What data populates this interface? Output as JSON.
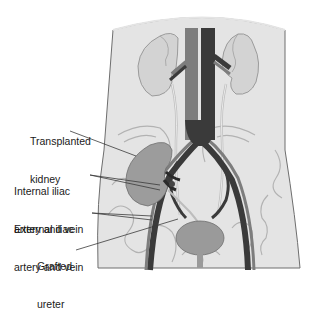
{
  "diagram": {
    "labels": [
      {
        "id": "transplanted-kidney",
        "lines": [
          "Transplanted",
          "kidney"
        ]
      },
      {
        "id": "internal-iliac",
        "lines": [
          "Internal iliac",
          "artery and vein"
        ]
      },
      {
        "id": "external-iliac",
        "lines": [
          "External iliac",
          "artery and vein"
        ]
      },
      {
        "id": "grafted-ureter",
        "lines": [
          "Grafted",
          "ureter"
        ]
      }
    ],
    "structures": [
      "torso-outline",
      "native-kidney-left",
      "native-kidney-right",
      "aorta",
      "vena-cava",
      "renal-vessels",
      "native-ureters",
      "pelvic-bones",
      "iliac-vessels",
      "transplanted-kidney",
      "bladder",
      "urethra"
    ],
    "colors": {
      "background": "#ffffff",
      "torso_fill": "#e4e4e4",
      "outline": "#7a7a7a",
      "kidney_native": "#d2d2d2",
      "kidney_transplant": "#9c9c9c",
      "artery": "#7d7d7d",
      "vein": "#3a3a3a",
      "bladder": "#9a9a9a",
      "bone_line": "#b4b4b4",
      "ureter": "#cfcfcf"
    }
  }
}
